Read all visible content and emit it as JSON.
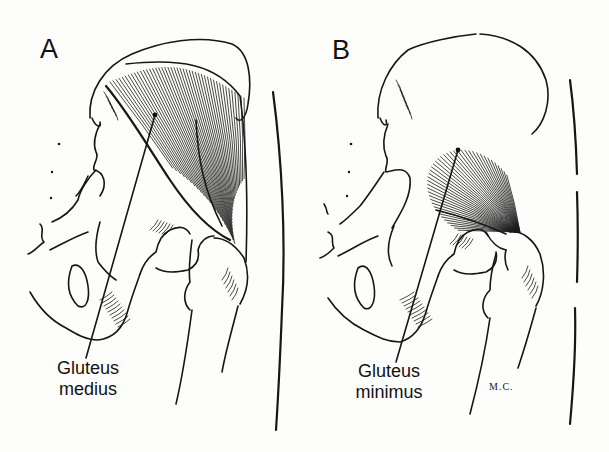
{
  "figure": {
    "panels": [
      {
        "id": "A",
        "letter": "A",
        "label_line1": "Gluteus",
        "label_line2": "medius",
        "muscle": "gluteus medius"
      },
      {
        "id": "B",
        "letter": "B",
        "label_line1": "Gluteus",
        "label_line2": "minimus",
        "muscle": "gluteus minimus",
        "signature": "M.C."
      }
    ],
    "colors": {
      "ink": "#161616",
      "paper": "#fdfdfc"
    }
  }
}
